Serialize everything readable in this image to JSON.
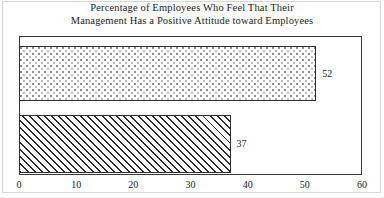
{
  "chart_data": {
    "type": "bar",
    "orientation": "horizontal",
    "title": "Percentage of Employees Who Feel That Their Management Has a Positive Attitude toward Employees",
    "title_lines": [
      "Percentage of Employees Who Feel That Their",
      "Management Has a Positive Attitude toward Employees"
    ],
    "xlabel": "",
    "ylabel": "",
    "xlim": [
      0,
      60
    ],
    "grid": false,
    "legend": "none",
    "xticks": [
      0,
      10,
      20,
      30,
      40,
      50,
      60
    ],
    "xtick_labels": [
      "0",
      "10",
      "20",
      "30",
      "40",
      "50",
      "60"
    ],
    "categories": [
      "bar-1",
      "bar-2"
    ],
    "values": [
      52,
      37
    ],
    "bars": [
      {
        "name": "bar-top",
        "value": 52,
        "label": "52",
        "fill": "dots"
      },
      {
        "name": "bar-bottom",
        "value": 37,
        "label": "37",
        "fill": "hatch"
      }
    ]
  },
  "colors": {
    "ink": "#1c1c1c",
    "frame": "#3a3a3a",
    "bar_outline": "#2e2e2e",
    "page_border": "#d7d7d7",
    "background": "#ffffff"
  }
}
